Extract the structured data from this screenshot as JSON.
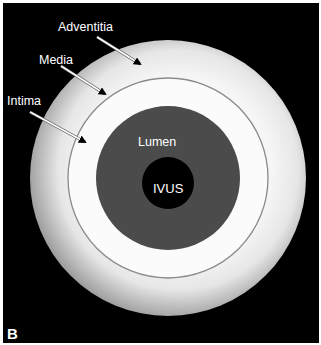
{
  "figure": {
    "panel_label": "B",
    "background_color": "#000000"
  },
  "layers": {
    "adventitia": {
      "label": "Adventitia",
      "color_outer": "#a9a9a9",
      "color_inner": "#f4f4f4"
    },
    "media": {
      "label": "Media",
      "color": "#8a8a8a"
    },
    "intima": {
      "label": "Intima",
      "color": "#fbfbfb"
    },
    "lumen": {
      "label": "Lumen",
      "color": "#4b4b4b"
    },
    "ivus": {
      "label": "IVUS",
      "color": "#000000"
    }
  },
  "geometry": {
    "center": [
      168,
      178
    ],
    "adventitia_radius": 138,
    "media_radius": 100,
    "lumen_radius": 72,
    "ivus_center": [
      168,
      183
    ],
    "ivus_radius": 26
  }
}
